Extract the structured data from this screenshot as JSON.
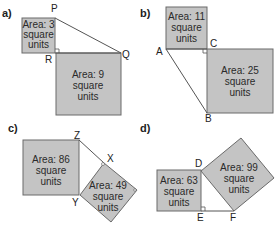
{
  "diagrams": [
    {
      "part": "a)",
      "vertices": [
        "P",
        "Q",
        "R"
      ],
      "squares": [
        {
          "area_label": "Area: 3",
          "line2": "square",
          "line3": "units"
        },
        {
          "area_label": "Area: 9",
          "line2": "square",
          "line3": "units"
        }
      ]
    },
    {
      "part": "b)",
      "vertices": [
        "A",
        "C",
        "B"
      ],
      "squares": [
        {
          "area_label": "Area: 11",
          "line2": "square",
          "line3": "units"
        },
        {
          "area_label": "Area: 25",
          "line2": "square",
          "line3": "units"
        }
      ]
    },
    {
      "part": "c)",
      "vertices": [
        "Z",
        "X",
        "Y"
      ],
      "squares": [
        {
          "area_label": "Area: 86",
          "line2": "square",
          "line3": "units"
        },
        {
          "area_label": "Area: 49",
          "line2": "square",
          "line3": "units"
        }
      ]
    },
    {
      "part": "d)",
      "vertices": [
        "D",
        "E",
        "F"
      ],
      "squares": [
        {
          "area_label": "Area: 63",
          "line2": "square",
          "line3": "units"
        },
        {
          "area_label": "Area: 99",
          "line2": "square",
          "line3": "units"
        }
      ]
    }
  ],
  "colors": {
    "square_fill": "#c4c4c4",
    "square_stroke": "#6a6a6a",
    "line": "#555555"
  }
}
